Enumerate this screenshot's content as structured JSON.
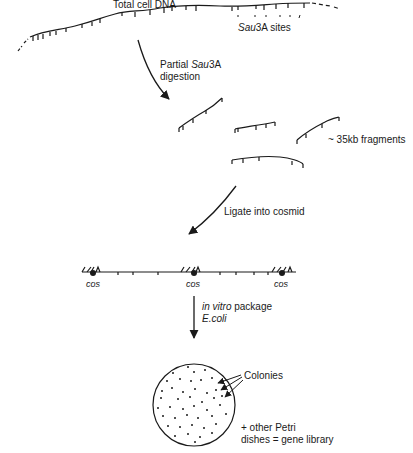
{
  "diagram": {
    "type": "flowchart",
    "labels": {
      "total_dna": "Total cell DNA",
      "sau3a_sites_italic": "Sau",
      "sau3a_sites_italic2": "3A sites",
      "partial_prefix": "Partial ",
      "partial_italic": "Sau",
      "partial_suffix": "3A",
      "digestion": "digestion",
      "fragments": "~ 35kb fragments",
      "ligate": "Ligate into cosmid",
      "cos_1": "cos",
      "cos_2": "cos",
      "cos_3": "cos",
      "in_vitro_italic": "in vitro",
      "package": " package",
      "ecoli": "E.coli",
      "colonies": "Colonies",
      "other_petri_1": "+ other Petri",
      "other_petri_2": "dishes = gene library"
    },
    "steps": [
      "Total cell DNA",
      "Partial Sau3A digestion",
      "~ 35kb fragments",
      "Ligate into cosmid",
      "in vitro package E.coli",
      "Colonies + other Petri dishes = gene library"
    ],
    "colors": {
      "ink": "#1a1a1a",
      "background": "#ffffff"
    }
  }
}
